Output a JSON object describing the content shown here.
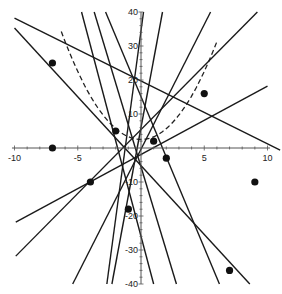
{
  "chart_data": {
    "type": "scatter",
    "title": "",
    "xlabel": "",
    "ylabel": "",
    "xlim": [
      -10,
      10
    ],
    "ylim": [
      -40,
      40
    ],
    "grid": false,
    "legend": null,
    "x_ticks": [
      -10,
      -5,
      5,
      10
    ],
    "x_tick_labels": [
      "-10",
      "-5",
      "5",
      "10"
    ],
    "y_ticks": [
      40,
      30,
      20,
      10,
      -10,
      -20,
      -30,
      -40
    ],
    "y_tick_labels": [
      "40",
      "30",
      "20",
      "10",
      "-10",
      "-20",
      "-30",
      "-40"
    ],
    "points": [
      {
        "x": -7.0,
        "y": 25
      },
      {
        "x": -7.0,
        "y": 0
      },
      {
        "x": -2.0,
        "y": 5
      },
      {
        "x": 1.0,
        "y": 2
      },
      {
        "x": 2.0,
        "y": -3
      },
      {
        "x": -4.0,
        "y": -10
      },
      {
        "x": -1.0,
        "y": -18
      },
      {
        "x": 5.0,
        "y": 16
      },
      {
        "x": 9.0,
        "y": -10
      },
      {
        "x": 7.0,
        "y": -36
      }
    ],
    "lines": [
      {
        "x1": -10.0,
        "y1": 38.2,
        "x2": 11.0,
        "y2": -0.6,
        "style": "solid"
      },
      {
        "x1": -10.0,
        "y1": 35.3,
        "x2": 8.6,
        "y2": -40.0,
        "style": "solid"
      },
      {
        "x1": -4.7,
        "y1": 40.0,
        "x2": 1.0,
        "y2": -40.0,
        "style": "solid"
      },
      {
        "x1": -3.7,
        "y1": 40.0,
        "x2": 2.8,
        "y2": -40.0,
        "style": "solid"
      },
      {
        "x1": -2.8,
        "y1": 40.0,
        "x2": 6.2,
        "y2": -40.0,
        "style": "solid"
      },
      {
        "x1": 0.2,
        "y1": 40.0,
        "x2": -2.7,
        "y2": -40.0,
        "style": "solid"
      },
      {
        "x1": 1.7,
        "y1": 40.0,
        "x2": -2.3,
        "y2": -40.0,
        "style": "solid"
      },
      {
        "x1": 5.5,
        "y1": 40.0,
        "x2": -5.4,
        "y2": -40.0,
        "style": "solid"
      },
      {
        "x1": 9.2,
        "y1": 40.0,
        "x2": -9.9,
        "y2": -31.8,
        "style": "solid"
      },
      {
        "x1": 10.0,
        "y1": 18.2,
        "x2": -9.9,
        "y2": -21.8,
        "style": "solid"
      }
    ],
    "curves": [
      {
        "type": "parabola",
        "style": "dashed",
        "vertex": {
          "x": 0.0,
          "y": 2.5
        },
        "a": 0.8,
        "x_range": [
          -6.3,
          6.0
        ]
      }
    ]
  }
}
